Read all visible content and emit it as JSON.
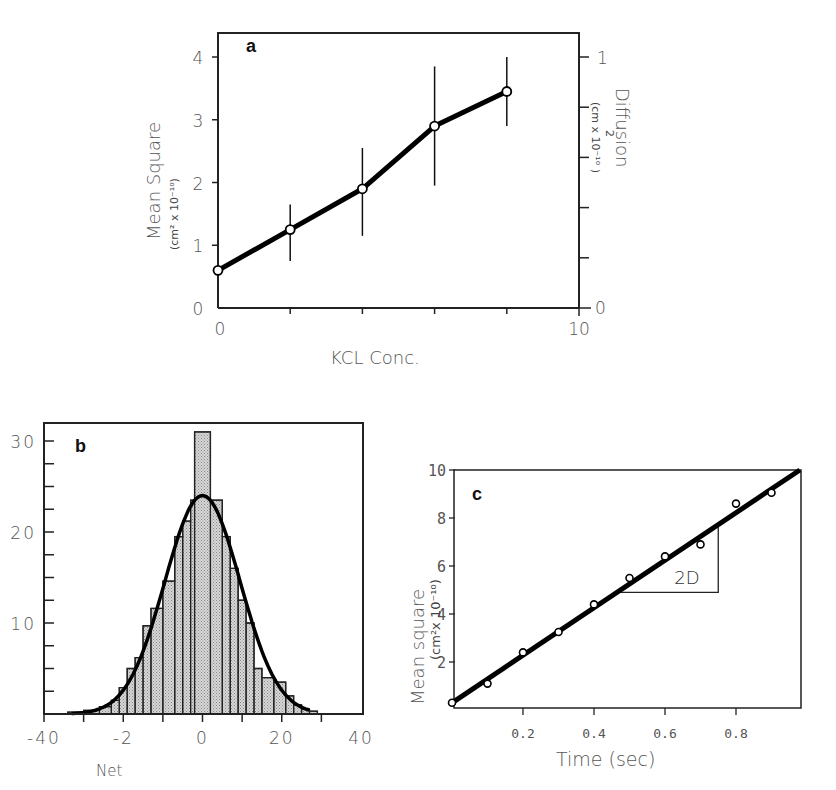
{
  "chart_data": [
    {
      "panel": "a",
      "type": "line",
      "xlabel": "KCL Conc.",
      "ylabel": "Mean Square",
      "ylabel_units": "(cm² x 10⁻¹⁰)",
      "y2label": "Diffusion",
      "y2label_units": "(cm² x 10⁻¹⁰)",
      "xlim": [
        0,
        10
      ],
      "ylim": [
        0,
        4
      ],
      "y2lim": [
        0,
        1
      ],
      "x_tick_labels": [
        "0",
        "10"
      ],
      "y_tick_labels": [
        "0",
        "1",
        "2",
        "3",
        "4"
      ],
      "y2_tick_labels": [
        "0",
        "1"
      ],
      "grid": false,
      "series": [
        {
          "name": "Mean Square",
          "x": [
            0,
            2,
            4,
            6,
            8
          ],
          "y": [
            0.6,
            1.25,
            1.9,
            2.9,
            3.45
          ],
          "err_low": [
            0.6,
            0.75,
            1.15,
            1.95,
            2.9
          ],
          "err_high": [
            0.6,
            1.65,
            2.55,
            3.85,
            4.0
          ]
        }
      ]
    },
    {
      "panel": "b",
      "type": "bar",
      "subtype": "histogram_with_gaussian_fit",
      "xlabel": "Net",
      "ylabel": "",
      "xlim": [
        -40,
        40
      ],
      "ylim": [
        0,
        31
      ],
      "x_tick_labels": [
        "-40",
        "-2",
        "0",
        "20",
        "40"
      ],
      "y_tick_labels": [
        "10",
        "20",
        "30"
      ],
      "grid": false,
      "bin_edges": [
        -34,
        -30,
        -26,
        -23,
        -21,
        -19,
        -17,
        -15,
        -13,
        -10,
        -7,
        -5,
        -3,
        -2,
        2,
        5,
        7,
        9,
        11,
        13,
        15,
        18,
        21,
        23,
        25,
        27,
        29
      ],
      "counts": [
        0.2,
        0.4,
        0.8,
        1.5,
        2.9,
        5.0,
        6.2,
        9.7,
        11.6,
        14.6,
        19.5,
        21.2,
        23.5,
        31.0,
        23.5,
        19.5,
        16.0,
        12.5,
        10.0,
        5.0,
        4.0,
        3.5,
        2.0,
        1.0,
        0.5,
        0.3
      ],
      "fit": {
        "type": "gaussian",
        "mean": 0,
        "amplitude": 24,
        "sigma": 9.5
      }
    },
    {
      "panel": "c",
      "type": "scatter",
      "xlabel": "Time (sec)",
      "ylabel": "Mean square",
      "ylabel_units": "(cm²x 10⁻¹⁰)",
      "xlim": [
        0,
        1.0
      ],
      "ylim": [
        0,
        10
      ],
      "x_tick_labels": [
        "0.2",
        "0.4",
        "0.6",
        "0.8"
      ],
      "y_tick_labels": [
        "2",
        "4",
        "6",
        "8",
        "10"
      ],
      "grid": false,
      "series": [
        {
          "name": "data",
          "x": [
            0,
            0.1,
            0.2,
            0.3,
            0.4,
            0.5,
            0.6,
            0.7,
            0.8,
            0.9
          ],
          "y": [
            0.3,
            1.1,
            2.4,
            3.25,
            4.4,
            5.5,
            6.4,
            6.9,
            8.6,
            9.05
          ]
        },
        {
          "name": "fit",
          "type": "line",
          "x": [
            0,
            0.98
          ],
          "y": [
            0.3,
            10.0
          ]
        }
      ],
      "annotations": [
        {
          "text": "2D",
          "type": "slope_triangle",
          "x0": 0.47,
          "y0": 4.9,
          "x1": 0.75,
          "y1": 7.75
        }
      ]
    }
  ],
  "labels": {
    "panel_a": "a",
    "panel_b": "b",
    "panel_c": "c",
    "a_xlabel": "KCL Conc.",
    "a_ylabel": "Mean Square",
    "a_ylabel_units": "(cm² x 10⁻¹⁰)",
    "a_y2label": "Diffusion",
    "a_y2label_sup": "2",
    "a_y2label_units": "(cm  x 10⁻¹⁰ )",
    "b_xlabel": "Net",
    "c_xlabel": "Time (sec)",
    "c_ylabel": "Mean square",
    "c_ylabel_units": "(cm²x 10⁻¹⁰)",
    "c_annotation": "2D"
  }
}
